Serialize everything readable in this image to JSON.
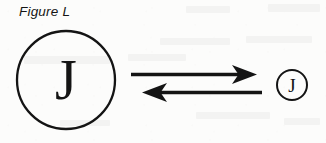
{
  "figure": {
    "caption": "Figure L",
    "background_color": "#fcfcfb",
    "ink_color": "#141414"
  },
  "diagram": {
    "type": "reversible-transformation",
    "left_node": {
      "shape": "circle",
      "label": "J",
      "size": "large",
      "center_x": 66,
      "center_y": 80,
      "radius": 49
    },
    "right_node": {
      "shape": "circle",
      "label": "J",
      "size": "small",
      "center_x": 292,
      "center_y": 85,
      "radius": 15
    },
    "connector": {
      "kind": "double-arrow-equilibrium",
      "arrows": [
        {
          "name": "forward-arrow",
          "direction": "right",
          "from_x": 131,
          "to_x": 257,
          "y": 74
        },
        {
          "name": "reverse-arrow",
          "direction": "left",
          "from_x": 262,
          "to_x": 142,
          "y": 92
        }
      ]
    }
  }
}
